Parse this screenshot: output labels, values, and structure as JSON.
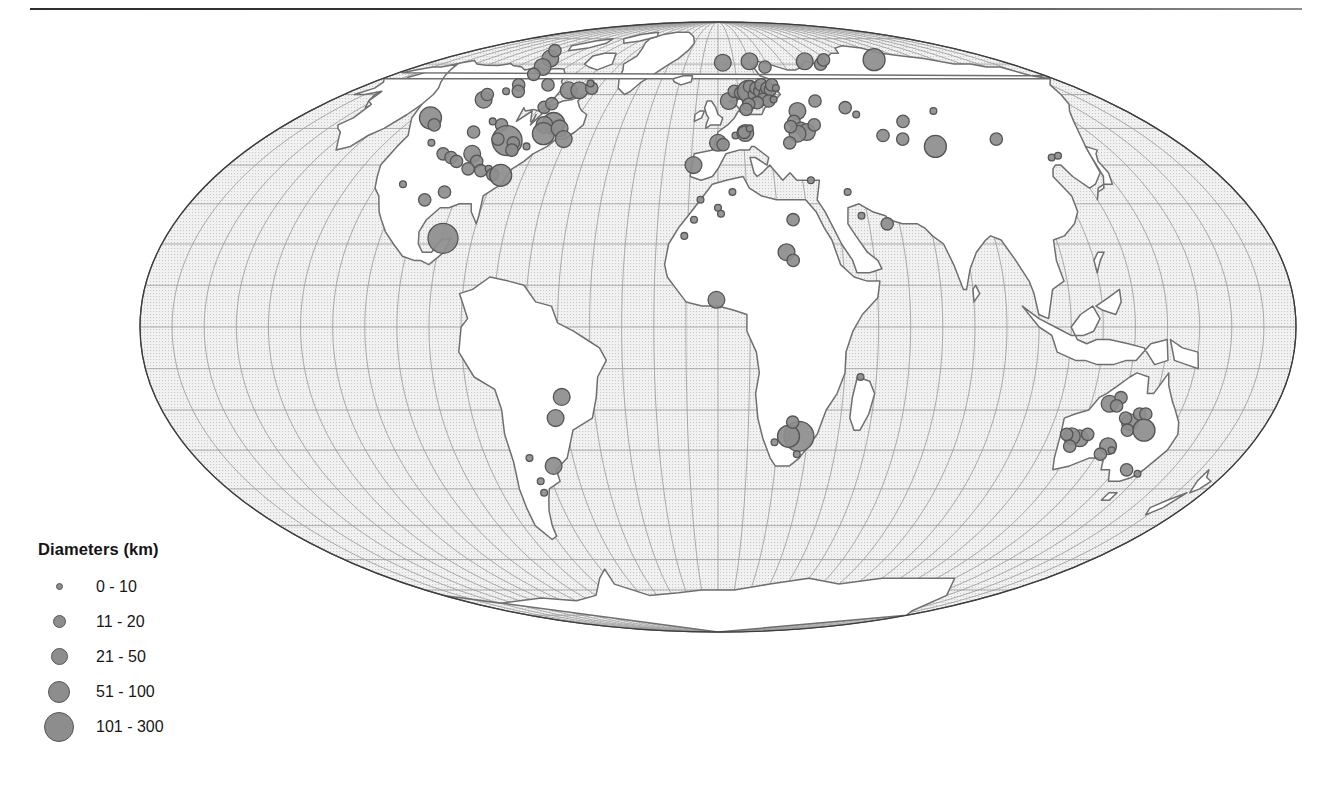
{
  "figure": {
    "type": "proportional-symbol-map",
    "projection": "Mollweide",
    "background_color": "#ffffff",
    "has_top_rule": true
  },
  "map": {
    "ocean_fill": "#efefef",
    "ocean_texture": "fine-dotted-stipple",
    "land_fill": "#ffffff",
    "coastline_color": "#6f6f6f",
    "border_color": "#8a8a8a",
    "graticule_color": "#9a9a9a",
    "graticule_spacing_degrees": 10,
    "outline_color": "#444444",
    "symbol_fill": "#8d8d8d",
    "symbol_stroke": "#555555"
  },
  "legend": {
    "title": "Diameters (km)",
    "items": [
      {
        "label": "0 - 10",
        "size_px": 7,
        "min_km": 0,
        "max_km": 10
      },
      {
        "label": "11 - 20",
        "size_px": 13,
        "min_km": 11,
        "max_km": 20
      },
      {
        "label": "21 - 50",
        "size_px": 17,
        "min_km": 21,
        "max_km": 50
      },
      {
        "label": "51 - 100",
        "size_px": 22,
        "min_km": 51,
        "max_km": 100
      },
      {
        "label": "101 - 300",
        "size_px": 30,
        "min_km": 101,
        "max_km": 300
      }
    ]
  },
  "chart_data": {
    "type": "scatter",
    "title": "",
    "xlabel": "Longitude",
    "ylabel": "Latitude",
    "projection": "Mollweide",
    "size_encoding": "crater diameter (km)",
    "legend_position": "bottom-left",
    "grid": true,
    "xlim": [
      -180,
      180
    ],
    "ylim": [
      -90,
      90
    ],
    "points": [
      {
        "lon": -110.0,
        "lat": 72.0,
        "d": 24
      },
      {
        "lon": -120.0,
        "lat": 75.0,
        "d": 12
      },
      {
        "lon": -104.5,
        "lat": 69.0,
        "d": 25
      },
      {
        "lon": -102.5,
        "lat": 66.5,
        "d": 12
      },
      {
        "lon": -109.5,
        "lat": 58.4,
        "d": 39
      },
      {
        "lon": -111.0,
        "lat": 60.0,
        "d": 16
      },
      {
        "lon": -104.0,
        "lat": 61.0,
        "d": 10
      },
      {
        "lon": -102.0,
        "lat": 63.0,
        "d": 12
      },
      {
        "lon": -98.0,
        "lat": 61.0,
        "d": 12
      },
      {
        "lon": -87.0,
        "lat": 63.0,
        "d": 14
      },
      {
        "lon": -73.7,
        "lat": 61.3,
        "d": 35
      },
      {
        "lon": -68.5,
        "lat": 61.3,
        "d": 28
      },
      {
        "lon": -63.3,
        "lat": 62.0,
        "d": 12
      },
      {
        "lon": -66.0,
        "lat": 63.5,
        "d": 10
      },
      {
        "lon": -78.0,
        "lat": 56.1,
        "d": 18
      },
      {
        "lon": -76.0,
        "lat": 57.2,
        "d": 12
      },
      {
        "lon": -68.7,
        "lat": 51.4,
        "d": 100
      },
      {
        "lon": -72.2,
        "lat": 51.0,
        "d": 30
      },
      {
        "lon": -70.3,
        "lat": 48.5,
        "d": 54
      },
      {
        "lon": -65.0,
        "lat": 50.0,
        "d": 24
      },
      {
        "lon": -61.0,
        "lat": 47.0,
        "d": 22
      },
      {
        "lon": -90.0,
        "lat": 51.0,
        "d": 15
      },
      {
        "lon": -95.0,
        "lat": 52.0,
        "d": 10
      },
      {
        "lon": -99.0,
        "lat": 49.0,
        "d": 12
      },
      {
        "lon": -83.0,
        "lat": 46.6,
        "d": 130
      },
      {
        "lon": -80.0,
        "lat": 46.0,
        "d": 20
      },
      {
        "lon": -87.0,
        "lat": 47.0,
        "d": 14
      },
      {
        "lon": -78.8,
        "lat": 44.0,
        "d": 12
      },
      {
        "lon": -74.0,
        "lat": 45.0,
        "d": 10
      },
      {
        "lon": -123.0,
        "lat": 53.0,
        "d": 70
      },
      {
        "lon": -118.0,
        "lat": 51.0,
        "d": 14
      },
      {
        "lon": -112.0,
        "lat": 46.0,
        "d": 10
      },
      {
        "lon": -104.0,
        "lat": 43.0,
        "d": 11
      },
      {
        "lon": -100.0,
        "lat": 42.0,
        "d": 13
      },
      {
        "lon": -97.0,
        "lat": 41.0,
        "d": 12
      },
      {
        "lon": -93.0,
        "lat": 43.0,
        "d": 35
      },
      {
        "lon": -89.5,
        "lat": 41.0,
        "d": 14
      },
      {
        "lon": -91.0,
        "lat": 39.0,
        "d": 16
      },
      {
        "lon": -86.0,
        "lat": 38.5,
        "d": 12
      },
      {
        "lon": -83.5,
        "lat": 39.0,
        "d": 10
      },
      {
        "lon": -81.0,
        "lat": 37.5,
        "d": 11
      },
      {
        "lon": -78.0,
        "lat": 37.3,
        "d": 85
      },
      {
        "lon": -95.0,
        "lat": 33.0,
        "d": 13
      },
      {
        "lon": -100.5,
        "lat": 31.0,
        "d": 13
      },
      {
        "lon": -111.0,
        "lat": 35.0,
        "d": 9
      },
      {
        "lon": -89.5,
        "lat": 21.4,
        "d": 180
      },
      {
        "lon": -50.0,
        "lat": -16.8,
        "d": 40
      },
      {
        "lon": -53.0,
        "lat": -22.0,
        "d": 48
      },
      {
        "lon": -65.0,
        "lat": -32.0,
        "d": 10
      },
      {
        "lon": -57.5,
        "lat": -34.0,
        "d": 22
      },
      {
        "lon": -64.0,
        "lat": -38.0,
        "d": 9
      },
      {
        "lon": -64.5,
        "lat": -41.0,
        "d": 9
      },
      {
        "lon": -9.0,
        "lat": 40.0,
        "d": 30
      },
      {
        "lon": 0.0,
        "lat": 46.0,
        "d": 23
      },
      {
        "lon": 2.0,
        "lat": 45.5,
        "d": 12
      },
      {
        "lon": 7.0,
        "lat": 48.0,
        "d": 9
      },
      {
        "lon": 11.0,
        "lat": 48.7,
        "d": 24
      },
      {
        "lon": 10.6,
        "lat": 48.9,
        "d": 12
      },
      {
        "lon": 13.0,
        "lat": 50.0,
        "d": 10
      },
      {
        "lon": 5.0,
        "lat": 58.0,
        "d": 40
      },
      {
        "lon": 8.0,
        "lat": 61.0,
        "d": 20
      },
      {
        "lon": 11.0,
        "lat": 60.5,
        "d": 16
      },
      {
        "lon": 13.5,
        "lat": 61.0,
        "d": 14
      },
      {
        "lon": 14.9,
        "lat": 61.0,
        "d": 52
      },
      {
        "lon": 16.0,
        "lat": 62.5,
        "d": 18
      },
      {
        "lon": 17.5,
        "lat": 60.0,
        "d": 14
      },
      {
        "lon": 19.0,
        "lat": 62.0,
        "d": 12
      },
      {
        "lon": 20.5,
        "lat": 61.0,
        "d": 16
      },
      {
        "lon": 22.0,
        "lat": 63.0,
        "d": 14
      },
      {
        "lon": 23.0,
        "lat": 60.5,
        "d": 12
      },
      {
        "lon": 24.5,
        "lat": 62.0,
        "d": 14
      },
      {
        "lon": 26.0,
        "lat": 61.5,
        "d": 18
      },
      {
        "lon": 27.5,
        "lat": 63.0,
        "d": 12
      },
      {
        "lon": 29.0,
        "lat": 62.0,
        "d": 10
      },
      {
        "lon": 21.0,
        "lat": 58.5,
        "d": 14
      },
      {
        "lon": 23.5,
        "lat": 58.0,
        "d": 12
      },
      {
        "lon": 26.0,
        "lat": 58.5,
        "d": 10
      },
      {
        "lon": 18.0,
        "lat": 57.5,
        "d": 12
      },
      {
        "lon": 14.0,
        "lat": 57.0,
        "d": 16
      },
      {
        "lon": 12.5,
        "lat": 55.5,
        "d": 14
      },
      {
        "lon": 3.0,
        "lat": 70.5,
        "d": 40
      },
      {
        "lon": 20.0,
        "lat": 71.0,
        "d": 45
      },
      {
        "lon": 28.0,
        "lat": 69.0,
        "d": 12
      },
      {
        "lon": 55.0,
        "lat": 71.0,
        "d": 45
      },
      {
        "lon": 63.0,
        "lat": 70.0,
        "d": 16
      },
      {
        "lon": 68.0,
        "lat": 71.5,
        "d": 12
      },
      {
        "lon": 35.0,
        "lat": 55.0,
        "d": 26
      },
      {
        "lon": 32.0,
        "lat": 52.0,
        "d": 20
      },
      {
        "lon": 34.0,
        "lat": 50.0,
        "d": 18
      },
      {
        "lon": 36.0,
        "lat": 49.0,
        "d": 24
      },
      {
        "lon": 32.0,
        "lat": 48.5,
        "d": 28
      },
      {
        "lon": 30.0,
        "lat": 50.5,
        "d": 16
      },
      {
        "lon": 40.0,
        "lat": 51.0,
        "d": 20
      },
      {
        "lon": 28.0,
        "lat": 46.0,
        "d": 12
      },
      {
        "lon": 45.0,
        "lat": 58.0,
        "d": 14
      },
      {
        "lon": 57.0,
        "lat": 56.0,
        "d": 13
      },
      {
        "lon": 60.0,
        "lat": 54.0,
        "d": 10
      },
      {
        "lon": 66.0,
        "lat": 48.0,
        "d": 18
      },
      {
        "lon": 73.0,
        "lat": 47.0,
        "d": 14
      },
      {
        "lon": 78.0,
        "lat": 52.0,
        "d": 11
      },
      {
        "lon": 84.0,
        "lat": 45.0,
        "d": 60
      },
      {
        "lon": 95.0,
        "lat": 55.0,
        "d": 10
      },
      {
        "lon": 101.0,
        "lat": 71.6,
        "d": 100
      },
      {
        "lon": 110.0,
        "lat": 47.0,
        "d": 12
      },
      {
        "lon": 125.0,
        "lat": 42.0,
        "d": 10
      },
      {
        "lon": 128.0,
        "lat": 42.5,
        "d": 10
      },
      {
        "lon": 33.0,
        "lat": 36.0,
        "d": 10
      },
      {
        "lon": 45.0,
        "lat": 33.0,
        "d": 10
      },
      {
        "lon": 48.0,
        "lat": 27.0,
        "d": 10
      },
      {
        "lon": 56.0,
        "lat": 25.0,
        "d": 12
      },
      {
        "lon": -6.0,
        "lat": 31.0,
        "d": 9
      },
      {
        "lon": -8.0,
        "lat": 26.0,
        "d": 9
      },
      {
        "lon": -11.0,
        "lat": 22.0,
        "d": 10
      },
      {
        "lon": 0.0,
        "lat": 29.0,
        "d": 10
      },
      {
        "lon": 1.0,
        "lat": 27.5,
        "d": 10
      },
      {
        "lon": 5.0,
        "lat": 33.0,
        "d": 9
      },
      {
        "lon": 25.0,
        "lat": 26.0,
        "d": 16
      },
      {
        "lon": 22.0,
        "lat": 18.0,
        "d": 24
      },
      {
        "lon": 24.0,
        "lat": 16.0,
        "d": 20
      },
      {
        "lon": -0.5,
        "lat": 6.5,
        "d": 25
      },
      {
        "lon": 27.0,
        "lat": -26.5,
        "d": 160
      },
      {
        "lon": 23.5,
        "lat": -26.5,
        "d": 70
      },
      {
        "lon": 24.5,
        "lat": -23.0,
        "d": 12
      },
      {
        "lon": 19.0,
        "lat": -28.0,
        "d": 10
      },
      {
        "lon": 27.0,
        "lat": -31.0,
        "d": 10
      },
      {
        "lon": 45.0,
        "lat": -12.0,
        "d": 8
      },
      {
        "lon": 126.0,
        "lat": -18.5,
        "d": 22
      },
      {
        "lon": 129.0,
        "lat": -17.0,
        "d": 16
      },
      {
        "lon": 128.5,
        "lat": -19.0,
        "d": 12
      },
      {
        "lon": 135.0,
        "lat": -23.0,
        "d": 24
      },
      {
        "lon": 133.0,
        "lat": -22.0,
        "d": 18
      },
      {
        "lon": 137.0,
        "lat": -21.0,
        "d": 14
      },
      {
        "lon": 139.0,
        "lat": -21.0,
        "d": 12
      },
      {
        "lon": 135.5,
        "lat": -25.0,
        "d": 14
      },
      {
        "lon": 141.0,
        "lat": -25.0,
        "d": 55
      },
      {
        "lon": 132.0,
        "lat": -29.0,
        "d": 50
      },
      {
        "lon": 131.0,
        "lat": -31.0,
        "d": 14
      },
      {
        "lon": 134.0,
        "lat": -30.0,
        "d": 10
      },
      {
        "lon": 121.0,
        "lat": -27.0,
        "d": 35
      },
      {
        "lon": 118.0,
        "lat": -26.5,
        "d": 24
      },
      {
        "lon": 116.0,
        "lat": -26.0,
        "d": 18
      },
      {
        "lon": 123.0,
        "lat": -26.0,
        "d": 12
      },
      {
        "lon": 119.0,
        "lat": -29.0,
        "d": 12
      },
      {
        "lon": 144.0,
        "lat": -35.0,
        "d": 16
      },
      {
        "lon": 149.0,
        "lat": -36.0,
        "d": 10
      }
    ]
  }
}
